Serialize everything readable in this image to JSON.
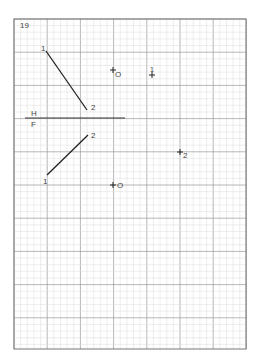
{
  "problem_number": "19",
  "fold_line": {
    "upper_label": "H",
    "lower_label": "F"
  },
  "horizontal_view": {
    "line_endpoints": [
      {
        "label": "1",
        "x": 46,
        "y": 51
      },
      {
        "label": "2",
        "x": 87,
        "y": 110
      }
    ],
    "origin_marker": {
      "label": "O",
      "x": 113,
      "y": 70
    },
    "point_marker": {
      "label": "1",
      "x": 152,
      "y": 75
    }
  },
  "frontal_view": {
    "line_endpoints": [
      {
        "label": "1",
        "x": 47,
        "y": 175
      },
      {
        "label": "2",
        "x": 88,
        "y": 135
      }
    ],
    "origin_marker": {
      "label": "O",
      "x": 113,
      "y": 185
    },
    "point_marker": {
      "label": "2",
      "x": 180,
      "y": 152
    }
  },
  "grid": {
    "left": 14,
    "top": 19,
    "right": 246,
    "bottom": 349,
    "major_spacing": 33.2,
    "minor_divisions": 5,
    "colors": {
      "major": "#9a9a9a",
      "minor": "#dcdcdc",
      "ink": "#222222",
      "border": "#777777"
    }
  }
}
